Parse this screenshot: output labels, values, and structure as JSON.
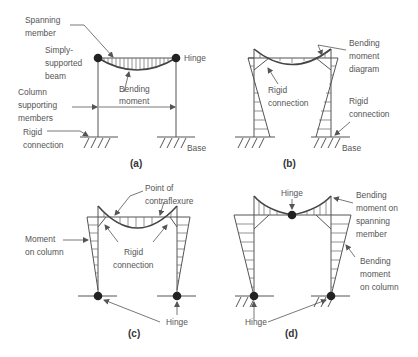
{
  "figure": {
    "panels": [
      {
        "id": "a",
        "caption": "(a)",
        "labels": {
          "spanning_member_1": "Spanning",
          "spanning_member_2": "member",
          "simply_supported_1": "Simply-",
          "simply_supported_2": "supported",
          "simply_supported_3": "beam",
          "hinge": "Hinge",
          "bending_moment_1": "Bending",
          "bending_moment_2": "moment",
          "column_1": "Column",
          "column_2": "supporting",
          "column_3": "members",
          "rigid_1": "Rigid",
          "rigid_2": "connection",
          "base": "Base"
        }
      },
      {
        "id": "b",
        "caption": "(b)",
        "labels": {
          "bmd_1": "Bending",
          "bmd_2": "moment",
          "bmd_3": "diagram",
          "rigid_left_1": "Rigid",
          "rigid_left_2": "connection",
          "rigid_right_1": "Rigid",
          "rigid_right_2": "connection",
          "base": "Base"
        }
      },
      {
        "id": "c",
        "caption": "(c)",
        "labels": {
          "contra_1": "Point of",
          "contra_2": "contraflexure",
          "moment_col_1": "Moment",
          "moment_col_2": "on column",
          "rigid_1": "Rigid",
          "rigid_2": "connection",
          "hinge": "Hinge"
        }
      },
      {
        "id": "d",
        "caption": "(d)",
        "labels": {
          "hinge_top": "Hinge",
          "bm_span_1": "Bending",
          "bm_span_2": "moment on",
          "bm_span_3": "spanning",
          "bm_span_4": "member",
          "bm_col_1": "Bending",
          "bm_col_2": "moment",
          "bm_col_3": "on column",
          "hinge_bottom": "Hinge"
        }
      }
    ]
  }
}
